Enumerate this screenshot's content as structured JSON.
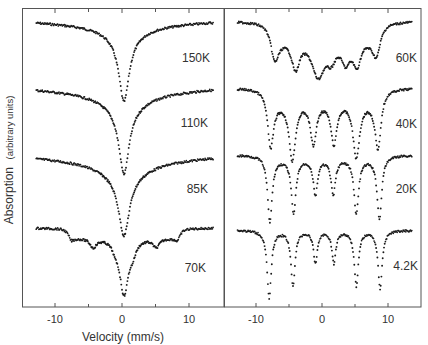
{
  "chart_data": {
    "type": "scatter",
    "title": "",
    "xlabel": "Velocity (mm/s)",
    "ylabel": "Absorption",
    "ylabel_units": "(arbitrary units)",
    "grid": false,
    "legend": "none (temperature labels placed beside each spectrum)",
    "panels": [
      {
        "position": "left",
        "xlim": [
          -15,
          15
        ],
        "xticks": [
          -10,
          0,
          10
        ],
        "xtick_labels": [
          "-10",
          "0",
          "10"
        ],
        "minor_xticks": [
          -5,
          5
        ],
        "series": [
          {
            "name": "150K",
            "shape": "singlet",
            "center": 0.3,
            "relative_depth": 0.9,
            "lines": [
              0.3
            ]
          },
          {
            "name": "110K",
            "shape": "singlet",
            "center": 0.3,
            "relative_depth": 0.95,
            "lines": [
              0.3
            ]
          },
          {
            "name": "85K",
            "shape": "singlet + broad wings",
            "center": 0.3,
            "relative_depth": 0.92,
            "lines": [
              0.3
            ]
          },
          {
            "name": "70K",
            "shape": "central singlet + weak broad sextet",
            "center": 0.3,
            "relative_depth": 0.95,
            "lines": [
              -7.6,
              -4.3,
              -1.0,
              0.3,
              1.6,
              5.1,
              8.3
            ]
          }
        ]
      },
      {
        "position": "right",
        "xlim": [
          -15,
          15
        ],
        "xticks": [
          -10,
          0,
          10
        ],
        "xtick_labels": [
          "-10",
          "0",
          "10"
        ],
        "minor_xticks": [
          -5,
          5
        ],
        "series": [
          {
            "name": "60K",
            "shape": "broadened sextet",
            "lines": [
              -7.2,
              -4.0,
              -0.6,
              2.1,
              5.3,
              8.3
            ]
          },
          {
            "name": "40K",
            "shape": "sextet",
            "lines": [
              -7.8,
              -4.5,
              -1.3,
              1.8,
              5.3,
              8.5
            ]
          },
          {
            "name": "20K",
            "shape": "sharp sextet",
            "lines": [
              -7.9,
              -4.3,
              -1.0,
              1.7,
              5.2,
              8.7
            ]
          },
          {
            "name": "4.2K",
            "shape": "sharp sextet",
            "lines": [
              -8.0,
              -4.4,
              -1.0,
              1.8,
              5.2,
              8.8
            ]
          }
        ]
      }
    ]
  },
  "labels": {
    "t150": "150K",
    "t110": "110K",
    "t85": "85K",
    "t70": "70K",
    "t60": "60K",
    "t40": "40K",
    "t20": "20K",
    "t4": "4.2K",
    "xlabel": "Velocity (mm/s)",
    "ylabel_main": "Absorption",
    "ylabel_units": "(arbitrary units)",
    "tick_m10": "-10",
    "tick_0": "0",
    "tick_10": "10"
  },
  "render": {
    "left": {
      "x0": 122,
      "scale": 6.7,
      "spectra": [
        {
          "base": 22,
          "slope": 8,
          "lines": [
            {
              "v": 0.3,
              "d": 63,
              "w": 0.9,
              "wide": [
                {
                  "d": 12,
                  "w": 3.2
                }
              ]
            }
          ]
        },
        {
          "base": 89,
          "slope": 10,
          "lines": [
            {
              "v": 0.3,
              "d": 64,
              "w": 0.9,
              "wide": [
                {
                  "d": 15,
                  "w": 3.6
                }
              ]
            }
          ]
        },
        {
          "base": 157,
          "slope": 8,
          "lines": [
            {
              "v": 0.3,
              "d": 58,
              "w": 0.95,
              "wide": [
                {
                  "d": 16,
                  "w": 4.2
                }
              ]
            }
          ]
        },
        {
          "base": 228,
          "slope": 0,
          "lines": [
            {
              "v": -7.6,
              "d": 7,
              "w": 0.5
            },
            {
              "v": -4.3,
              "d": 9,
              "w": 0.6
            },
            {
              "v": -1.0,
              "d": 6,
              "w": 0.5
            },
            {
              "v": 0.3,
              "d": 56,
              "w": 0.8
            },
            {
              "v": 1.6,
              "d": 10,
              "w": 0.6
            },
            {
              "v": 5.1,
              "d": 9,
              "w": 0.6
            },
            {
              "v": 8.3,
              "d": 7,
              "w": 0.5
            }
          ],
          "plateau": {
            "from": -7.6,
            "to": 8.3,
            "d": 9
          }
        }
      ]
    },
    "right": {
      "x0": 322,
      "scale": 6.6,
      "spectra": [
        {
          "base": 21,
          "slope": 0,
          "lines": [
            {
              "v": -7.2,
              "d": 30,
              "w": 0.75
            },
            {
              "v": -4.0,
              "d": 30,
              "w": 0.75
            },
            {
              "v": -0.6,
              "d": 38,
              "w": 1.2
            },
            {
              "v": 1.4,
              "d": 18,
              "w": 0.9
            },
            {
              "v": 3.6,
              "d": 22,
              "w": 0.8
            },
            {
              "v": 5.3,
              "d": 26,
              "w": 0.75
            },
            {
              "v": 8.3,
              "d": 26,
              "w": 0.75
            }
          ],
          "plateau": {
            "from": -7.2,
            "to": 8.3,
            "d": 14
          }
        },
        {
          "base": 88,
          "slope": 0,
          "lines": [
            {
              "v": -7.8,
              "d": 52,
              "w": 0.55
            },
            {
              "v": -4.5,
              "d": 58,
              "w": 0.6
            },
            {
              "v": -1.3,
              "d": 42,
              "w": 0.55
            },
            {
              "v": 1.8,
              "d": 42,
              "w": 0.55
            },
            {
              "v": 5.2,
              "d": 56,
              "w": 0.6
            },
            {
              "v": 8.5,
              "d": 54,
              "w": 0.55
            }
          ],
          "plateau": {
            "from": -7.8,
            "to": 8.5,
            "d": 12
          }
        },
        {
          "base": 155,
          "slope": 0,
          "lines": [
            {
              "v": -7.9,
              "d": 65,
              "w": 0.42
            },
            {
              "v": -4.3,
              "d": 55,
              "w": 0.42
            },
            {
              "v": -1.0,
              "d": 36,
              "w": 0.4
            },
            {
              "v": 1.7,
              "d": 36,
              "w": 0.4
            },
            {
              "v": 5.2,
              "d": 55,
              "w": 0.42
            },
            {
              "v": 8.7,
              "d": 62,
              "w": 0.42
            }
          ],
          "plateau": {
            "from": -7.9,
            "to": 8.7,
            "d": 3
          }
        },
        {
          "base": 230,
          "slope": 0,
          "lines": [
            {
              "v": -8.0,
              "d": 68,
              "w": 0.38
            },
            {
              "v": -4.4,
              "d": 55,
              "w": 0.38
            },
            {
              "v": -1.0,
              "d": 32,
              "w": 0.36
            },
            {
              "v": 1.8,
              "d": 32,
              "w": 0.36
            },
            {
              "v": 5.2,
              "d": 55,
              "w": 0.38
            },
            {
              "v": 8.8,
              "d": 58,
              "w": 0.38
            }
          ],
          "plateau": {
            "from": -8.0,
            "to": 8.8,
            "d": 0
          }
        }
      ]
    }
  }
}
